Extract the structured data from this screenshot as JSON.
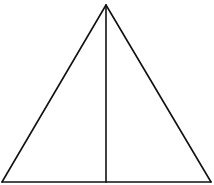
{
  "diagram": {
    "type": "geometry",
    "shape": "triangle",
    "stroke_color": "#111111",
    "background": "#ffffff",
    "stroke_width": 1.6,
    "vertices": {
      "apex": [
        106,
        5
      ],
      "base_left": [
        2,
        182
      ],
      "base_right": [
        211,
        182
      ]
    },
    "segments": [
      {
        "name": "left-side",
        "from": "apex",
        "to": "base_left"
      },
      {
        "name": "right-side",
        "from": "apex",
        "to": "base_right"
      },
      {
        "name": "base",
        "from": "base_left",
        "to": "base_right"
      },
      {
        "name": "altitude",
        "from": [
          106,
          5
        ],
        "to": [
          106,
          182
        ]
      }
    ],
    "labels": []
  }
}
